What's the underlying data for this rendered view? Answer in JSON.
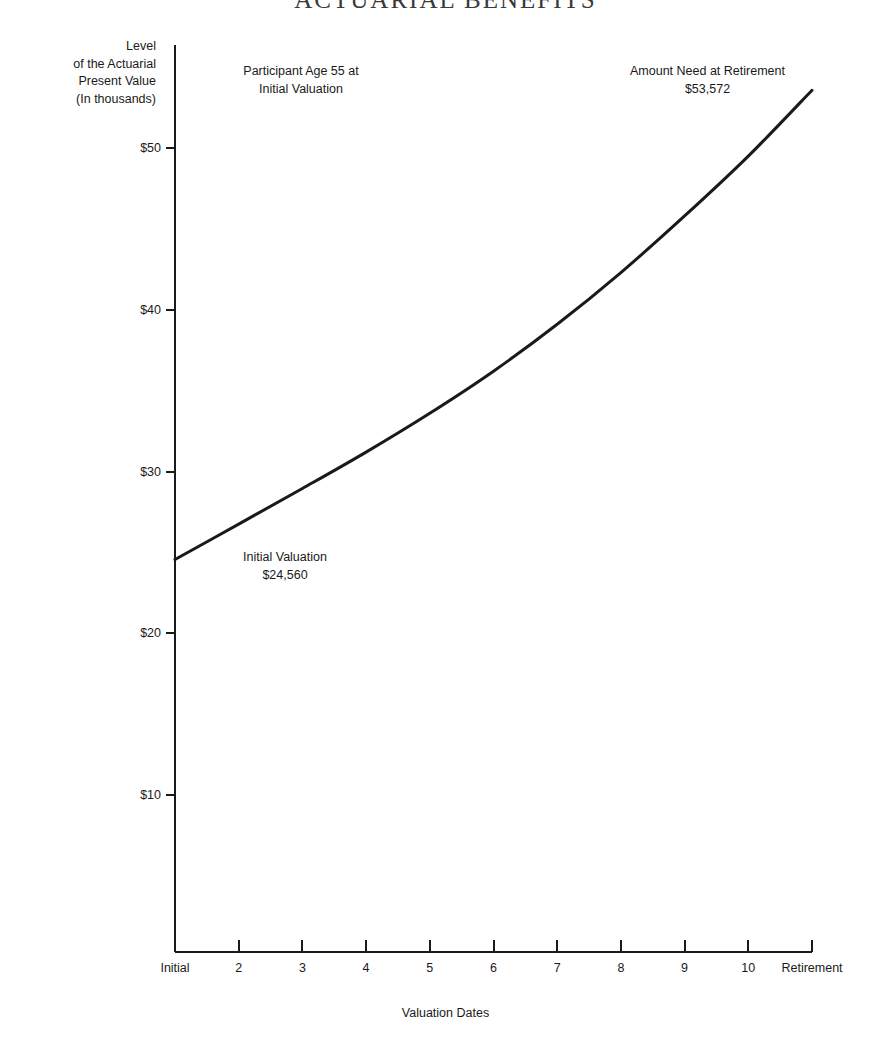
{
  "title": "ACTUARIAL BENEFITS",
  "background_color": "#ffffff",
  "ink_color": "#1a1a1a",
  "y_axis_caption": {
    "line1": "Level",
    "line2": "of the Actuarial",
    "line3": "Present Value",
    "line4": "(In thousands)"
  },
  "x_axis_title": "Valuation Dates",
  "annotations": {
    "participant": {
      "line1": "Participant Age 55 at",
      "line2": "Initial Valuation"
    },
    "retirement": {
      "line1": "Amount Need at Retirement",
      "line2": "$53,572"
    },
    "initial": {
      "line1": "Initial Valuation",
      "line2": "$24,560"
    }
  },
  "chart_data": {
    "type": "line",
    "title": "ACTUARIAL BENEFITS",
    "xlabel": "Valuation Dates",
    "ylabel": "Level of the Actuarial Present Value (In thousands)",
    "grid": false,
    "legend": "none",
    "x_tick_labels": [
      "Initial",
      "2",
      "3",
      "4",
      "5",
      "6",
      "7",
      "8",
      "9",
      "10",
      "Retirement"
    ],
    "y_tick_labels": [
      "$10",
      "$20",
      "$30",
      "$40",
      "$50"
    ],
    "y_tick_values": [
      10,
      20,
      30,
      40,
      50
    ],
    "ylim": [
      0,
      56.8
    ],
    "xlim": [
      0,
      10
    ],
    "units": "thousands of dollars",
    "series": [
      {
        "name": "Actuarial Present Value",
        "x": [
          0,
          1,
          2,
          3,
          4,
          5,
          6,
          7,
          8,
          9,
          10
        ],
        "x_labels": [
          "Initial",
          "2",
          "3",
          "4",
          "5",
          "6",
          "7",
          "8",
          "9",
          "10",
          "Retirement"
        ],
        "values": [
          24.56,
          26.75,
          28.95,
          31.2,
          33.6,
          36.2,
          39.1,
          42.3,
          45.8,
          49.5,
          53.572
        ]
      }
    ],
    "data_labels": [
      {
        "label": "Initial Valuation",
        "value": "$24,560",
        "x": 0,
        "y": 24.56
      },
      {
        "label": "Amount Need at Retirement",
        "value": "$53,572",
        "x": 10,
        "y": 53.572
      }
    ]
  }
}
